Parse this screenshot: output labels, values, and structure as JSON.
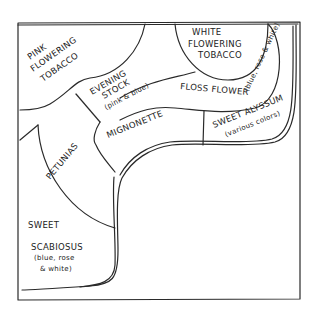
{
  "diagram": {
    "type": "garden-bed-plan",
    "beds": [
      {
        "id": "pink-flowering-tobacco",
        "lines": [
          "PINK",
          "FLOWERING",
          "TOBACCO"
        ]
      },
      {
        "id": "white-flowering-tobacco",
        "lines": [
          "WHITE",
          "FLOWERING",
          "TOBACCO"
        ]
      },
      {
        "id": "evening-stock",
        "lines": [
          "EVENING",
          "STOCK",
          "(pink & blue)"
        ]
      },
      {
        "id": "floss-flower",
        "lines": [
          "FLOSS FLOWER",
          "(blue, rose & white)"
        ]
      },
      {
        "id": "mignonette",
        "lines": [
          "MIGNONETTE"
        ]
      },
      {
        "id": "sweet-alyssum",
        "lines": [
          "SWEET ALYSSUM",
          "(various colors)"
        ]
      },
      {
        "id": "petunias",
        "lines": [
          "PETUNIAS"
        ]
      },
      {
        "id": "sweet-scabiosus",
        "lines": [
          "SWEET",
          "SCABIOSUS",
          "(blue, rose",
          "& white)"
        ]
      }
    ]
  }
}
